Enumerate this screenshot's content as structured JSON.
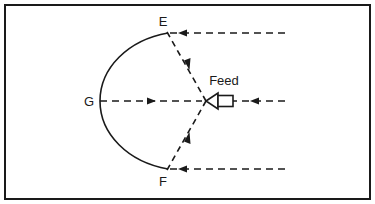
{
  "figure": {
    "kind": "parabolic-reflector-antenna-diagram",
    "background_color": "#ffffff",
    "ink_color": "#1a1a1a",
    "border_color": "#1a1a1a",
    "labels": {
      "rim_top": "E",
      "rim_bottom": "F",
      "vertex": "G",
      "feed": "Feed"
    },
    "geometry": {
      "vertex_point": [
        100,
        101
      ],
      "focus_point": [
        206,
        101
      ],
      "rim_top_point": [
        168,
        33
      ],
      "rim_bottom_point": [
        168,
        169
      ],
      "axis_y": 101
    },
    "rays": [
      {
        "name": "incoming-top",
        "from": [
          285,
          33
        ],
        "to": [
          168,
          33
        ],
        "direction": "left",
        "arrow_at": [
          183,
          33
        ]
      },
      {
        "name": "reflected-top",
        "from": [
          168,
          33
        ],
        "to": [
          206,
          101
        ],
        "direction": "down-right",
        "arrow_at": [
          187,
          67
        ]
      },
      {
        "name": "incoming-bottom",
        "from": [
          285,
          169
        ],
        "to": [
          168,
          169
        ],
        "direction": "left",
        "arrow_at": [
          183,
          169
        ]
      },
      {
        "name": "reflected-bottom",
        "from": [
          168,
          169
        ],
        "to": [
          206,
          101
        ],
        "direction": "up-right",
        "arrow_at": [
          187,
          135
        ]
      },
      {
        "name": "axis-left",
        "from": [
          100,
          101
        ],
        "to": [
          206,
          101
        ],
        "direction": "right",
        "arrow_at": [
          148,
          101
        ]
      },
      {
        "name": "axis-right",
        "from": [
          285,
          101
        ],
        "to": [
          232,
          101
        ],
        "direction": "left",
        "arrow_at": [
          257,
          101
        ]
      }
    ]
  }
}
